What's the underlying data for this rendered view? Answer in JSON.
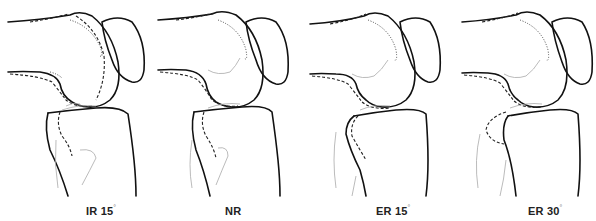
{
  "figure": {
    "panels": [
      {
        "id": "ir15",
        "label_main": "IR 15",
        "label_unit": "°",
        "left": 0
      },
      {
        "id": "nr",
        "label_main": "NR",
        "label_unit": "",
        "left": 148
      },
      {
        "id": "er15",
        "label_main": "ER 15",
        "label_unit": "°",
        "left": 296
      },
      {
        "id": "er30",
        "label_main": "ER 30",
        "label_unit": "°",
        "left": 446
      }
    ],
    "line_styles": {
      "solid": "bone outline",
      "dashed": "condyle outline",
      "dotted": "condyle outline",
      "thin_gray": "fibula / soft tissue outline"
    }
  }
}
